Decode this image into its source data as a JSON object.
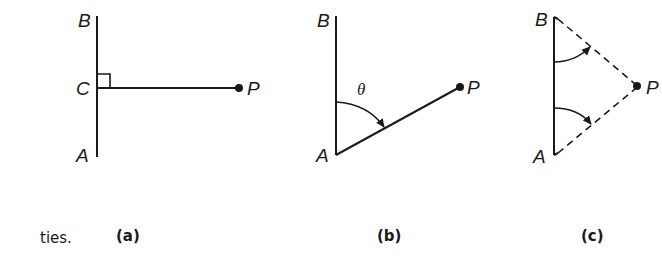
{
  "figure": {
    "trailing_text": "ties.",
    "panels": [
      {
        "id": "a",
        "caption": "(a)",
        "labels": {
          "B": "B",
          "C": "C",
          "A": "A",
          "P": "P"
        },
        "description": "Vertical segment AB with point C; perpendicular line from C to point P with right-angle marker"
      },
      {
        "id": "b",
        "caption": "(b)",
        "labels": {
          "B": "B",
          "A": "A",
          "P": "P",
          "angle": "θ"
        },
        "description": "Vertical segment AB; line from A to P; arc arrow marking angle θ from AB to AP"
      },
      {
        "id": "c",
        "caption": "(c)",
        "labels": {
          "B": "B",
          "A": "A",
          "P": "P"
        },
        "description": "Vertical segment AB; dashed lines from B and A to P; two curved arrows pointing toward the dashed lines"
      }
    ]
  },
  "colors": {
    "ink": "#1a1a1a",
    "background": "#ffffff"
  }
}
